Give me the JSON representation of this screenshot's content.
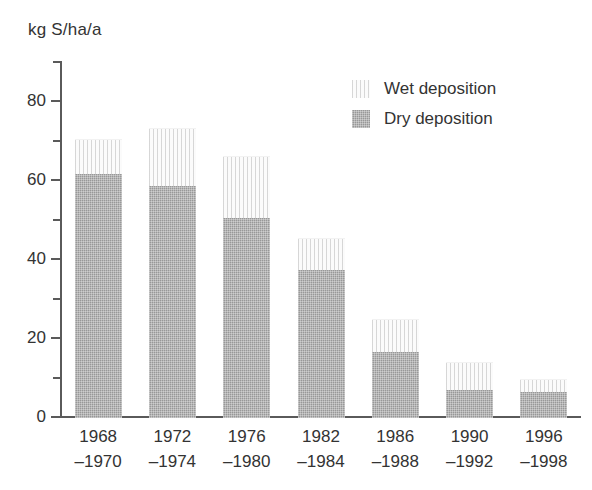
{
  "chart_data": {
    "type": "bar",
    "subtype": "stacked",
    "title": "",
    "xlabel": "",
    "ylabel": "kg S/ha/a",
    "ylim": [
      0,
      90
    ],
    "y_major_ticks": [
      0,
      20,
      40,
      60,
      80
    ],
    "y_minor_ticks": [
      10,
      30,
      50,
      70,
      90
    ],
    "grid": false,
    "legend_position": "top-right",
    "categories": [
      "1968\n–1970",
      "1972\n–1974",
      "1976\n–1980",
      "1982\n–1984",
      "1986\n–1988",
      "1990\n–1992",
      "1996\n–1998"
    ],
    "category_lines": [
      [
        "1968",
        "–1970"
      ],
      [
        "1972",
        "–1974"
      ],
      [
        "1976",
        "–1980"
      ],
      [
        "1982",
        "–1984"
      ],
      [
        "1986",
        "–1988"
      ],
      [
        "1990",
        "–1992"
      ],
      [
        "1996",
        "–1998"
      ]
    ],
    "series": [
      {
        "name": "Dry deposition",
        "color": "#989898",
        "values": [
          61.8,
          58.8,
          50.7,
          37.5,
          16.8,
          7.0,
          6.5
        ]
      },
      {
        "name": "Wet deposition",
        "color": "#fbfbfb",
        "values": [
          8.8,
          14.5,
          15.6,
          7.8,
          8.1,
          7.0,
          3.1
        ]
      }
    ],
    "totals": [
      70.6,
      73.3,
      66.3,
      45.3,
      24.9,
      14.0,
      9.6
    ]
  },
  "axis": {
    "unit_label": "kg S/ha/a",
    "tick_labels": [
      "80",
      "60",
      "40",
      "20",
      "0"
    ]
  },
  "legend": {
    "items": [
      {
        "label": "Wet deposition",
        "swatch": "wet-deposition-swatch"
      },
      {
        "label": "Dry deposition",
        "swatch": "dry-deposition-swatch"
      }
    ]
  },
  "colors": {
    "dry": "#989898",
    "wet": "#fbfbfb",
    "axis": "#5a5a5a",
    "text": "#333333",
    "background": "#ffffff"
  }
}
